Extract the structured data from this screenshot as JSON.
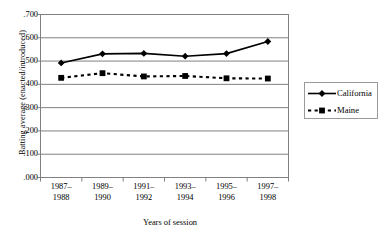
{
  "chart_data": {
    "type": "line",
    "title": "",
    "xlabel": "Years of session",
    "ylabel": "Batting average (enacted/introduced)",
    "categories": [
      "1987–\n1988",
      "1989–\n1990",
      "1991–\n1992",
      "1993–\n1994",
      "1995–\n1996",
      "1997–\n1998"
    ],
    "categories_lines": [
      [
        "1987–",
        "1988"
      ],
      [
        "1989–",
        "1990"
      ],
      [
        "1991–",
        "1992"
      ],
      [
        "1993–",
        "1994"
      ],
      [
        "1995–",
        "1996"
      ],
      [
        "1997–",
        "1998"
      ]
    ],
    "series": [
      {
        "name": "California",
        "values": [
          0.492,
          0.531,
          0.533,
          0.521,
          0.532,
          0.584
        ],
        "marker": "diamond",
        "linestyle": "solid",
        "color": "#000000"
      },
      {
        "name": "Maine",
        "values": [
          0.428,
          0.448,
          0.434,
          0.436,
          0.426,
          0.425
        ],
        "marker": "square",
        "linestyle": "dashed",
        "color": "#000000"
      }
    ],
    "ylim": [
      0.0,
      0.7
    ],
    "ytick_values": [
      0.7,
      0.6,
      0.5,
      0.4,
      0.3,
      0.2,
      0.1,
      0.0
    ],
    "ytick_labels": [
      ".700",
      ".600",
      ".500",
      ".400",
      ".300",
      ".200",
      ".100",
      ".000"
    ],
    "grid": "horizontal",
    "grid_color": "#808080",
    "legend_position": "right",
    "plot_border_color": "#808080",
    "background": "#ffffff"
  }
}
